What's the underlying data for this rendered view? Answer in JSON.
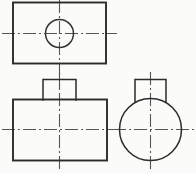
{
  "drawing": {
    "title": "Orthographic projection - three views",
    "background_color": "#fbfbf9",
    "line_color": "#2b2b2b",
    "centerline_color": "#555555",
    "canvas": {
      "width": 196,
      "height": 173
    },
    "views": [
      {
        "name": "top-view",
        "label": "Top view",
        "shapes": [
          {
            "kind": "rectangle",
            "name": "top-view-outline",
            "x": 13,
            "y": 2,
            "width": 93,
            "height": 61
          },
          {
            "kind": "circle",
            "name": "top-view-hole",
            "cx": 59,
            "cy": 33,
            "r": 14
          }
        ],
        "centerlines": [
          {
            "name": "top-view-horizontal-centerline",
            "orientation": "horizontal",
            "x1": 2,
            "y1": 33,
            "x2": 117,
            "y2": 33
          },
          {
            "name": "top-view-vertical-centerline",
            "orientation": "vertical",
            "x1": 59,
            "y1": 0,
            "x2": 59,
            "y2": 88
          }
        ]
      },
      {
        "name": "front-view",
        "label": "Front view",
        "shapes": [
          {
            "kind": "rectangle",
            "name": "front-view-body",
            "x": 13,
            "y": 99,
            "width": 94,
            "height": 61
          },
          {
            "kind": "rectangle",
            "name": "front-view-boss",
            "x": 43,
            "y": 79,
            "width": 33,
            "height": 20
          }
        ],
        "centerlines": [
          {
            "name": "front-view-horizontal-centerline",
            "orientation": "horizontal",
            "x1": 2,
            "y1": 129,
            "x2": 118,
            "y2": 129
          },
          {
            "name": "front-view-vertical-centerline",
            "orientation": "vertical",
            "x1": 59,
            "y1": 72,
            "x2": 59,
            "y2": 170
          }
        ]
      },
      {
        "name": "right-side-view",
        "label": "Right side view",
        "shapes": [
          {
            "kind": "circle",
            "name": "side-view-body-circle",
            "cx": 150,
            "cy": 129,
            "r": 31
          },
          {
            "kind": "boss-on-circle",
            "name": "side-view-boss",
            "x": 135,
            "y": 79,
            "width": 31,
            "height": 23
          }
        ],
        "centerlines": [
          {
            "name": "side-view-horizontal-centerline",
            "orientation": "horizontal",
            "x1": 113,
            "y1": 129,
            "x2": 194,
            "y2": 129
          },
          {
            "name": "side-view-vertical-centerline",
            "orientation": "vertical",
            "x1": 150,
            "y1": 72,
            "x2": 150,
            "y2": 170
          }
        ]
      }
    ]
  }
}
